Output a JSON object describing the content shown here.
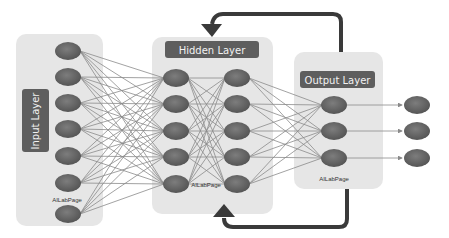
{
  "diagram": {
    "layers": {
      "input": {
        "label": "Input Layer",
        "node_count": 7,
        "watermark": "AILabPage"
      },
      "hidden": {
        "label": "Hidden Layer",
        "columns": 2,
        "nodes_per_column": 5,
        "watermark": "AILabPage"
      },
      "output": {
        "label": "Output Layer",
        "node_count": 3,
        "watermark": "AILabPage"
      },
      "outputs": {
        "node_count": 3
      }
    },
    "connections": [
      "input -> hidden column 1 (fully connected)",
      "hidden column 1 -> hidden column 2 (fully connected)",
      "hidden column 2 -> output (fully connected)",
      "output -> final outputs (arrows)",
      "output -> hidden (feedback loop, top and bottom)"
    ],
    "colors": {
      "panel": "#e6e6e6",
      "label_box": "#5e5e5e",
      "label_text": "#f2f2f2",
      "node": "#6b6b6b",
      "edge": "#8a8a8a",
      "feedback": "#3a3a3a"
    }
  }
}
